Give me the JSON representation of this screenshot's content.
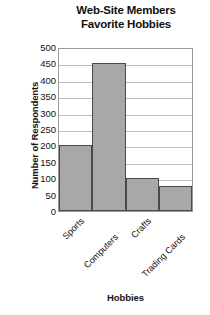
{
  "chart_data": {
    "type": "bar",
    "title": "Web-Site Members Favorite Hobbies",
    "title_lines": [
      "Web-Site Members",
      "Favorite Hobbies"
    ],
    "categories": [
      "Sports",
      "Computers",
      "Crafts",
      "Trading Cards"
    ],
    "values": [
      200,
      450,
      100,
      75
    ],
    "xlabel": "Hobbies",
    "ylabel": "Number of Respondents",
    "ylim": [
      0,
      500
    ],
    "ytick_step": 50,
    "yticks": [
      500,
      450,
      400,
      350,
      300,
      250,
      200,
      150,
      100,
      50,
      0
    ],
    "grid": "horizontal",
    "legend": "none",
    "bar_color": "#a8a8a8",
    "bar_border_color": "#4a4a4a",
    "gridline_color": "#bdbdbd",
    "axis_color": "#9a9a9a",
    "background": "#ffffff"
  }
}
